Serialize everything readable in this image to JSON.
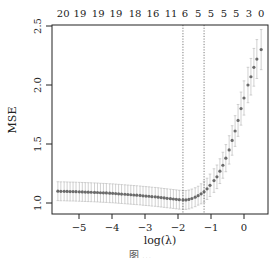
{
  "chart_data": {
    "type": "scatter",
    "title": "",
    "xlabel": "log(λ)",
    "ylabel": "MSE",
    "xlim": [
      -5.75,
      0.73
    ],
    "ylim": [
      0.93,
      2.53
    ],
    "x_ticks": [
      -5,
      -4,
      -3,
      -2,
      -1,
      0
    ],
    "x_tick_labels": [
      "−5",
      "−4",
      "−3",
      "−2",
      "−1",
      "0"
    ],
    "y_ticks": [
      1.0,
      1.5,
      2.0,
      2.5
    ],
    "y_tick_labels": [
      "1.0",
      "1.5",
      "2.0",
      "2.5"
    ],
    "top_axis_labels": [
      "20",
      "19",
      "19",
      "19",
      "18",
      "16",
      "11",
      "6",
      "5",
      "5",
      "5",
      "5",
      "3",
      "0"
    ],
    "top_axis_positions": [
      -5.48,
      -4.97,
      -4.42,
      -3.88,
      -3.3,
      -2.76,
      -2.21,
      -1.79,
      -1.39,
      -1.0,
      -0.61,
      -0.24,
      0.15,
      0.52
    ],
    "top_axis_meaning": "number of nonzero coefficients",
    "vlines": [
      {
        "x": -1.85,
        "style": "dotted",
        "label": "lambda.min"
      },
      {
        "x": -1.21,
        "style": "dotted",
        "label": "lambda.1se"
      }
    ],
    "grid": false,
    "legend": null,
    "series": [
      {
        "name": "Cross-validated MSE",
        "x": [
          -5.64,
          -5.55,
          -5.45,
          -5.36,
          -5.27,
          -5.18,
          -5.09,
          -4.99,
          -4.9,
          -4.81,
          -4.72,
          -4.63,
          -4.53,
          -4.44,
          -4.35,
          -4.26,
          -4.17,
          -4.07,
          -3.98,
          -3.89,
          -3.8,
          -3.71,
          -3.61,
          -3.52,
          -3.43,
          -3.34,
          -3.25,
          -3.15,
          -3.06,
          -2.97,
          -2.88,
          -2.79,
          -2.69,
          -2.6,
          -2.51,
          -2.42,
          -2.33,
          -2.23,
          -2.14,
          -2.05,
          -1.96,
          -1.85,
          -1.76,
          -1.67,
          -1.58,
          -1.48,
          -1.39,
          -1.3,
          -1.21,
          -1.12,
          -1.03,
          -0.91,
          -0.82,
          -0.73,
          -0.64,
          -0.55,
          -0.45,
          -0.36,
          -0.27,
          -0.18,
          -0.09,
          0.0,
          0.12,
          0.21,
          0.3,
          0.39,
          0.52
        ],
        "values": [
          1.1,
          1.099,
          1.099,
          1.098,
          1.097,
          1.097,
          1.096,
          1.095,
          1.094,
          1.093,
          1.092,
          1.091,
          1.09,
          1.089,
          1.087,
          1.086,
          1.085,
          1.083,
          1.082,
          1.08,
          1.078,
          1.076,
          1.074,
          1.072,
          1.07,
          1.068,
          1.066,
          1.064,
          1.061,
          1.059,
          1.057,
          1.054,
          1.052,
          1.049,
          1.046,
          1.043,
          1.04,
          1.037,
          1.034,
          1.031,
          1.028,
          1.026,
          1.026,
          1.03,
          1.038,
          1.049,
          1.062,
          1.078,
          1.095,
          1.12,
          1.15,
          1.19,
          1.222,
          1.27,
          1.32,
          1.38,
          1.45,
          1.53,
          1.61,
          1.7,
          1.8,
          1.89,
          2.0,
          2.07,
          2.15,
          2.22,
          2.3
        ],
        "err": [
          0.08,
          0.08,
          0.08,
          0.08,
          0.08,
          0.08,
          0.08,
          0.08,
          0.08,
          0.08,
          0.08,
          0.08,
          0.08,
          0.08,
          0.08,
          0.08,
          0.08,
          0.08,
          0.08,
          0.08,
          0.08,
          0.08,
          0.08,
          0.08,
          0.08,
          0.08,
          0.08,
          0.08,
          0.08,
          0.08,
          0.08,
          0.08,
          0.08,
          0.08,
          0.08,
          0.08,
          0.08,
          0.08,
          0.08,
          0.08,
          0.08,
          0.08,
          0.08,
          0.08,
          0.08,
          0.08,
          0.08,
          0.085,
          0.09,
          0.09,
          0.095,
          0.1,
          0.1,
          0.105,
          0.11,
          0.115,
          0.12,
          0.125,
          0.13,
          0.135,
          0.14,
          0.145,
          0.15,
          0.155,
          0.16,
          0.165,
          0.17
        ],
        "point_color": "#6b6b6b",
        "errorbar_color": "#bdbdbd"
      }
    ]
  },
  "caption_partial": "图 ..."
}
